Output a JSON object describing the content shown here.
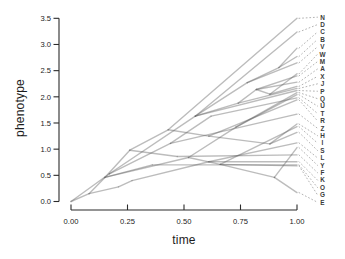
{
  "chart_data": {
    "type": "line",
    "variant": "phylogenetic-traitgram",
    "title": "",
    "xlabel": "time",
    "ylabel": "phenotype",
    "xlim": [
      0,
      1
    ],
    "ylim": [
      0,
      3.5
    ],
    "grid": false,
    "legend": "none",
    "x_ticks": [
      {
        "value": 0.0,
        "label": "0.00"
      },
      {
        "value": 0.25,
        "label": "0.25"
      },
      {
        "value": 0.5,
        "label": "0.50"
      },
      {
        "value": 0.75,
        "label": "0.75"
      },
      {
        "value": 1.0,
        "label": "1.00"
      }
    ],
    "y_ticks": [
      {
        "value": 0.0,
        "label": "0.0"
      },
      {
        "value": 0.5,
        "label": "0.5"
      },
      {
        "value": 1.0,
        "label": "1.0"
      },
      {
        "value": 1.5,
        "label": "1.5"
      },
      {
        "value": 2.0,
        "label": "2.0"
      },
      {
        "value": 2.5,
        "label": "2.5"
      },
      {
        "value": 3.0,
        "label": "3.0"
      },
      {
        "value": 3.5,
        "label": "3.5"
      }
    ],
    "root": [
      0.0,
      0.0
    ],
    "tips": [
      {
        "label": "N",
        "time": 1.0,
        "phenotype": 3.5
      },
      {
        "label": "D",
        "time": 1.0,
        "phenotype": 3.24
      },
      {
        "label": "C",
        "time": 1.0,
        "phenotype": 2.93
      },
      {
        "label": "B",
        "time": 1.0,
        "phenotype": 2.77
      },
      {
        "label": "V",
        "time": 1.0,
        "phenotype": 2.65
      },
      {
        "label": "W",
        "time": 1.0,
        "phenotype": 2.44
      },
      {
        "label": "M",
        "time": 1.0,
        "phenotype": 2.4
      },
      {
        "label": "A",
        "time": 1.0,
        "phenotype": 2.28
      },
      {
        "label": "X",
        "time": 1.0,
        "phenotype": 2.2
      },
      {
        "label": "J",
        "time": 1.0,
        "phenotype": 2.16
      },
      {
        "label": "P",
        "time": 1.0,
        "phenotype": 2.12
      },
      {
        "label": "Q",
        "time": 1.0,
        "phenotype": 2.08
      },
      {
        "label": "U",
        "time": 1.0,
        "phenotype": 2.04
      },
      {
        "label": "T",
        "time": 1.0,
        "phenotype": 1.98
      },
      {
        "label": "R",
        "time": 1.0,
        "phenotype": 1.94
      },
      {
        "label": "Z",
        "time": 1.0,
        "phenotype": 1.67
      },
      {
        "label": "H",
        "time": 1.0,
        "phenotype": 1.48
      },
      {
        "label": "I",
        "time": 1.0,
        "phenotype": 1.43
      },
      {
        "label": "S",
        "time": 1.0,
        "phenotype": 1.32
      },
      {
        "label": "L",
        "time": 1.0,
        "phenotype": 1.12
      },
      {
        "label": "Y",
        "time": 1.0,
        "phenotype": 1.03
      },
      {
        "label": "F",
        "time": 1.0,
        "phenotype": 0.89
      },
      {
        "label": "K",
        "time": 1.0,
        "phenotype": 0.76
      },
      {
        "label": "O",
        "time": 1.0,
        "phenotype": 0.7
      },
      {
        "label": "G",
        "time": 1.0,
        "phenotype": 0.68
      },
      {
        "label": "E",
        "time": 1.0,
        "phenotype": 0.17
      }
    ],
    "edges": [
      [
        [
          0.0,
          0.0
        ],
        [
          0.08,
          0.15
        ]
      ],
      [
        [
          0.0,
          0.0
        ],
        [
          0.17,
          0.53
        ]
      ],
      [
        [
          0.08,
          0.15
        ],
        [
          0.15,
          0.46
        ]
      ],
      [
        [
          0.08,
          0.15
        ],
        [
          0.21,
          0.28
        ]
      ],
      [
        [
          0.21,
          0.28
        ],
        [
          0.27,
          0.4
        ]
      ],
      [
        [
          0.15,
          0.46
        ],
        [
          0.26,
          0.98
        ]
      ],
      [
        [
          0.15,
          0.46
        ],
        [
          0.52,
          0.84
        ]
      ],
      [
        [
          0.15,
          0.46
        ],
        [
          0.36,
          0.7
        ]
      ],
      [
        [
          0.17,
          0.53
        ],
        [
          0.44,
          1.11
        ]
      ],
      [
        [
          0.17,
          0.53
        ],
        [
          0.55,
          1.63
        ]
      ],
      [
        [
          0.26,
          0.98
        ],
        [
          0.43,
          1.37
        ]
      ],
      [
        [
          0.26,
          0.98
        ],
        [
          0.47,
          0.86
        ]
      ],
      [
        [
          0.43,
          1.37
        ],
        [
          0.61,
          1.25
        ]
      ],
      [
        [
          0.44,
          1.11
        ],
        [
          0.62,
          1.63
        ]
      ],
      [
        [
          0.55,
          1.63
        ],
        [
          0.78,
          2.27
        ]
      ],
      [
        [
          0.55,
          1.63
        ],
        [
          0.74,
          1.88
        ]
      ],
      [
        [
          0.78,
          2.27
        ],
        [
          0.92,
          2.56
        ]
      ],
      [
        [
          0.74,
          1.88
        ],
        [
          0.82,
          2.14
        ]
      ],
      [
        [
          0.82,
          2.14
        ],
        [
          0.88,
          2.05
        ]
      ],
      [
        [
          0.52,
          0.84
        ],
        [
          0.73,
          1.42
        ]
      ],
      [
        [
          0.52,
          0.84
        ],
        [
          0.66,
          0.71
        ]
      ],
      [
        [
          0.61,
          1.25
        ],
        [
          0.88,
          1.1
        ]
      ],
      [
        [
          0.27,
          0.4
        ],
        [
          0.61,
          0.76
        ]
      ],
      [
        [
          0.66,
          0.71
        ],
        [
          0.9,
          0.46
        ]
      ],
      [
        [
          0.43,
          1.37
        ],
        [
          1.0,
          3.5
        ]
      ],
      [
        [
          0.55,
          1.63
        ],
        [
          1.0,
          3.24
        ]
      ],
      [
        [
          0.92,
          2.56
        ],
        [
          1.0,
          2.93
        ]
      ],
      [
        [
          0.92,
          2.56
        ],
        [
          1.0,
          2.77
        ]
      ],
      [
        [
          0.78,
          2.27
        ],
        [
          1.0,
          2.65
        ]
      ],
      [
        [
          0.88,
          2.05
        ],
        [
          1.0,
          2.44
        ]
      ],
      [
        [
          0.82,
          2.14
        ],
        [
          1.0,
          2.4
        ]
      ],
      [
        [
          0.82,
          2.14
        ],
        [
          1.0,
          2.28
        ]
      ],
      [
        [
          0.88,
          2.05
        ],
        [
          1.0,
          2.2
        ]
      ],
      [
        [
          0.74,
          1.88
        ],
        [
          1.0,
          2.16
        ]
      ],
      [
        [
          0.55,
          1.63
        ],
        [
          1.0,
          2.12
        ]
      ],
      [
        [
          0.73,
          1.42
        ],
        [
          1.0,
          2.08
        ]
      ],
      [
        [
          0.73,
          1.42
        ],
        [
          1.0,
          2.04
        ]
      ],
      [
        [
          0.62,
          1.63
        ],
        [
          1.0,
          1.98
        ]
      ],
      [
        [
          0.61,
          1.25
        ],
        [
          1.0,
          1.94
        ]
      ],
      [
        [
          0.44,
          1.11
        ],
        [
          1.0,
          1.67
        ]
      ],
      [
        [
          0.88,
          1.1
        ],
        [
          1.0,
          1.48
        ]
      ],
      [
        [
          0.66,
          0.71
        ],
        [
          1.0,
          1.43
        ]
      ],
      [
        [
          0.88,
          1.1
        ],
        [
          1.0,
          1.32
        ]
      ],
      [
        [
          0.61,
          0.76
        ],
        [
          1.0,
          1.12
        ]
      ],
      [
        [
          0.9,
          0.46
        ],
        [
          1.0,
          1.03
        ]
      ],
      [
        [
          0.47,
          0.86
        ],
        [
          1.0,
          0.89
        ]
      ],
      [
        [
          0.61,
          0.76
        ],
        [
          1.0,
          0.76
        ]
      ],
      [
        [
          0.36,
          0.7
        ],
        [
          1.0,
          0.7
        ]
      ],
      [
        [
          0.66,
          0.71
        ],
        [
          1.0,
          0.68
        ]
      ],
      [
        [
          0.9,
          0.46
        ],
        [
          1.0,
          0.17
        ]
      ]
    ],
    "style": {
      "branch_color": "#5f5f5f",
      "branch_opacity": 0.42,
      "connector_color": "#a9a9a9",
      "axis_color": "#2b2b2b",
      "tick_label_color": "#222222",
      "tip_label_color": "#3a3a3a",
      "background": "#ffffff"
    }
  }
}
